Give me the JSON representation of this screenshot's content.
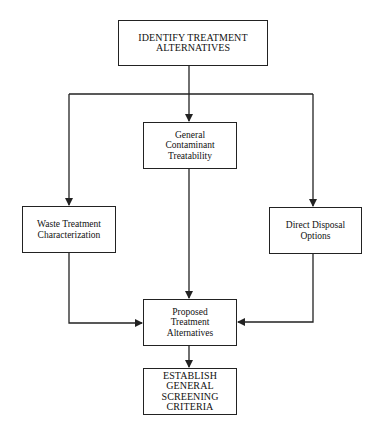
{
  "diagram": {
    "type": "flowchart",
    "nodes": {
      "identify": {
        "label": "IDENTIFY TREATMENT\nALTERNATIVES"
      },
      "general": {
        "label": "General\nContaminant\nTreatability"
      },
      "waste": {
        "label": "Waste Treatment\nCharacterization"
      },
      "direct": {
        "label": "Direct Disposal\nOptions"
      },
      "proposed": {
        "label": "Proposed\nTreatment\nAlternatives"
      },
      "establish": {
        "label": "ESTABLISH\nGENERAL\nSCREENING\nCRITERIA"
      }
    },
    "edges": [
      {
        "from": "identify",
        "to": "general"
      },
      {
        "from": "identify",
        "to": "waste"
      },
      {
        "from": "identify",
        "to": "direct"
      },
      {
        "from": "general",
        "to": "proposed"
      },
      {
        "from": "waste",
        "to": "proposed"
      },
      {
        "from": "direct",
        "to": "proposed"
      },
      {
        "from": "proposed",
        "to": "establish"
      }
    ],
    "colors": {
      "line": "#222222",
      "background": "#ffffff"
    }
  }
}
